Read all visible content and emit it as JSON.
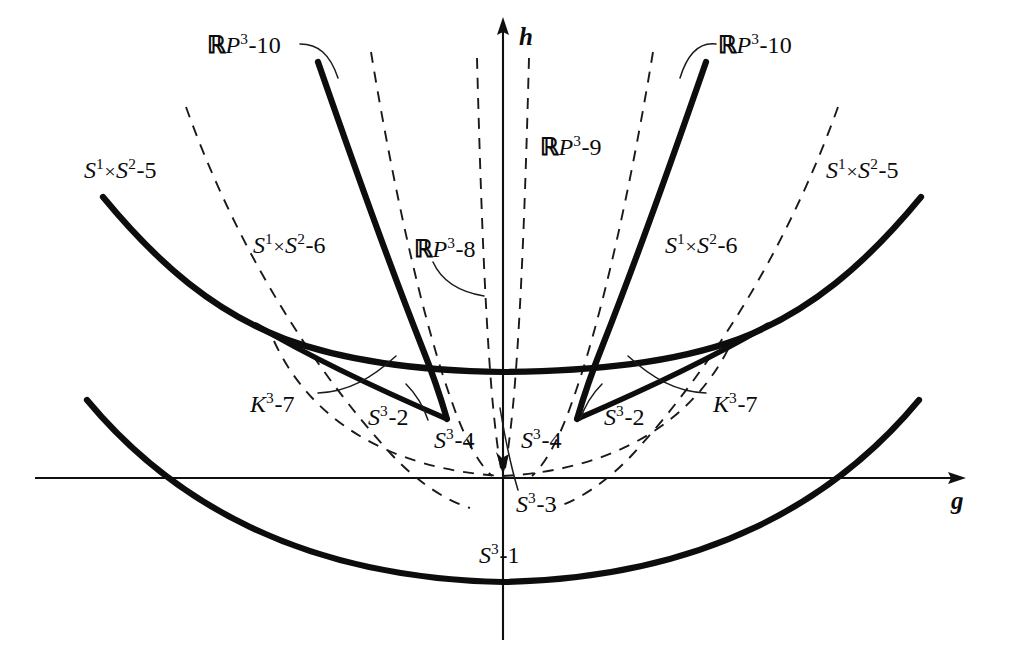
{
  "figure": {
    "domain": "Diagram",
    "background_color": "#ffffff",
    "ink_color": "#0d0d0d",
    "width": 1018,
    "height": 671
  },
  "axes": {
    "vertical": {
      "name": "h",
      "label": "h",
      "x": 503,
      "top": 18,
      "bottom": 640,
      "arrow": "up"
    },
    "horizontal": {
      "name": "g",
      "label": "g",
      "y": 478,
      "left": 35,
      "right": 965,
      "arrow": "right"
    }
  },
  "labels": [
    {
      "id": "rp3-10-left",
      "prefix_bb": "ℝ",
      "prefix_it": "P",
      "sup": "3",
      "suffix": "-10",
      "x": 207,
      "y": 33
    },
    {
      "id": "rp3-10-right",
      "prefix_bb": "ℝ",
      "prefix_it": "P",
      "sup": "3",
      "suffix": "-10",
      "x": 718,
      "y": 33
    },
    {
      "id": "rp3-9",
      "prefix_bb": "ℝ",
      "prefix_it": "P",
      "sup": "3",
      "suffix": "-9",
      "x": 540,
      "y": 135
    },
    {
      "id": "rp3-8",
      "prefix_bb": "ℝ",
      "prefix_it": "P",
      "sup": "3",
      "suffix": "-8",
      "x": 414,
      "y": 237
    },
    {
      "id": "s1s2-5-left",
      "prefix_it": "S",
      "sup": "1",
      "times": "×",
      "mid_it": "S",
      "sup2": "2",
      "suffix": "-5",
      "x": 84,
      "y": 158
    },
    {
      "id": "s1s2-5-right",
      "prefix_it": "S",
      "sup": "1",
      "times": "×",
      "mid_it": "S",
      "sup2": "2",
      "suffix": "-5",
      "x": 826,
      "y": 158
    },
    {
      "id": "s1s2-6-left",
      "prefix_it": "S",
      "sup": "1",
      "times": "×",
      "mid_it": "S",
      "sup2": "2",
      "suffix": "-6",
      "x": 253,
      "y": 233
    },
    {
      "id": "s1s2-6-right",
      "prefix_it": "S",
      "sup": "1",
      "times": "×",
      "mid_it": "S",
      "sup2": "2",
      "suffix": "-6",
      "x": 665,
      "y": 233
    },
    {
      "id": "k3-7-left",
      "prefix_it": "K",
      "sup": "3",
      "suffix": "-7",
      "x": 250,
      "y": 392
    },
    {
      "id": "k3-7-right",
      "prefix_it": "K",
      "sup": "3",
      "suffix": "-7",
      "x": 713,
      "y": 392
    },
    {
      "id": "s3-2-left",
      "prefix_it": "S",
      "sup": "3",
      "suffix": "-2",
      "x": 368,
      "y": 405
    },
    {
      "id": "s3-2-right",
      "prefix_it": "S",
      "sup": "3",
      "suffix": "-2",
      "x": 604,
      "y": 405
    },
    {
      "id": "s3-4-left",
      "prefix_it": "S",
      "sup": "3",
      "suffix": "-4",
      "x": 434,
      "y": 428
    },
    {
      "id": "s3-4-right",
      "prefix_it": "S",
      "sup": "3",
      "suffix": "-4",
      "x": 521,
      "y": 428
    },
    {
      "id": "s3-3",
      "prefix_it": "S",
      "sup": "3",
      "suffix": "-3",
      "x": 516,
      "y": 492
    },
    {
      "id": "s3-1",
      "prefix_it": "S",
      "sup": "3",
      "suffix": "-1",
      "x": 479,
      "y": 543
    }
  ],
  "curves": {
    "bold": [
      {
        "id": "upper-parabola-left",
        "role": "S1xS2-5 boundary left branch"
      },
      {
        "id": "upper-parabola-right",
        "role": "S1xS2-5 boundary right branch"
      },
      {
        "id": "steep-left",
        "role": "RP3-10 boundary left"
      },
      {
        "id": "steep-right",
        "role": "RP3-10 boundary right"
      },
      {
        "id": "cusp-left",
        "role": "S3-2 cusp left"
      },
      {
        "id": "cusp-right",
        "role": "S3-2 cusp right"
      },
      {
        "id": "bottom-parabola",
        "role": "S3-1 boundary"
      }
    ],
    "dashed": [
      {
        "id": "outer-dashed-left",
        "role": "S1xS2-6 region boundary left"
      },
      {
        "id": "outer-dashed-right",
        "role": "S1xS2-6 region boundary right"
      },
      {
        "id": "mid-dashed-left",
        "role": "RP3-8 region boundary left"
      },
      {
        "id": "mid-dashed-right",
        "role": "RP3-8 region boundary right"
      },
      {
        "id": "narrow-dashed-left",
        "role": "RP3-9 region boundary left"
      },
      {
        "id": "narrow-dashed-right",
        "role": "RP3-9 region boundary right"
      },
      {
        "id": "wide-dashed",
        "role": "S3-4 lower boundary"
      }
    ]
  }
}
